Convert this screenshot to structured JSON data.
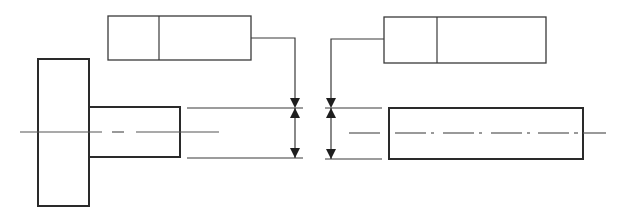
{
  "diagram": {
    "title": "",
    "type": "geometric tolerancing drawing",
    "colors": {
      "line": "#2a2a2a",
      "background": "#ffffff",
      "centerline": "#555555"
    },
    "left_view": {
      "feature_control_frame": {
        "symbol_cell": "",
        "tolerance_cell": ""
      },
      "part": "flanged shaft",
      "leader": "arrow to shaft diameter extension lines"
    },
    "right_view": {
      "feature_control_frame": {
        "symbol_cell": "",
        "tolerance_cell": ""
      },
      "part": "cylindrical shaft",
      "leader": "arrow to shaft diameter extension lines"
    }
  }
}
